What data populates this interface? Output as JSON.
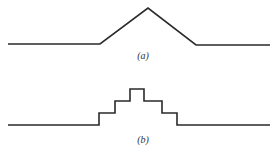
{
  "figure": {
    "panels": [
      {
        "label": "(a)",
        "shape": "triangular-pulse"
      },
      {
        "label": "(b)",
        "shape": "staircase-pulse"
      }
    ],
    "line_color": "#2a2a2a"
  }
}
